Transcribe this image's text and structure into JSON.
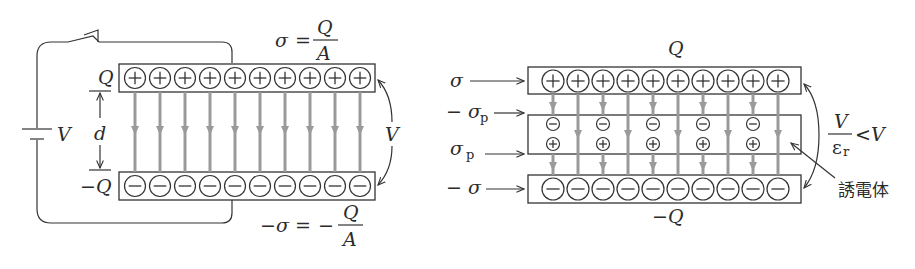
{
  "left_diagram": {
    "title": "parallel-plate capacitor connected to battery",
    "battery_label": "V",
    "top_charge_label": "Q",
    "bottom_charge_label": "−Q",
    "gap_label": "d",
    "voltage_label": "V",
    "top_density": {
      "lhs": "σ",
      "eq": "=",
      "num": "Q",
      "den": "A"
    },
    "bottom_density": {
      "lhs": "−σ",
      "eq": "=",
      "neg": "−",
      "num": "Q",
      "den": "A"
    },
    "plate_charges": 10,
    "field_lines": 10
  },
  "right_diagram": {
    "title": "parallel-plate capacitor with dielectric",
    "top_charge_label": "Q",
    "bottom_charge_label": "−Q",
    "labels": {
      "sigma": "σ",
      "neg_sigma_p": "− σ",
      "neg_sigma_p_sub": "p",
      "sigma_p": "σ",
      "sigma_p_sub": "p",
      "neg_sigma": "− σ"
    },
    "voltage": {
      "num": "V",
      "den": "ε",
      "den_sub": "r",
      "rel": "<V"
    },
    "dielectric_label": "誘電体",
    "plate_charges": 10,
    "polarization_pairs": 5
  },
  "colors": {
    "line": "#333333",
    "field_arrow": "#9a9a9a",
    "background": "#ffffff"
  }
}
